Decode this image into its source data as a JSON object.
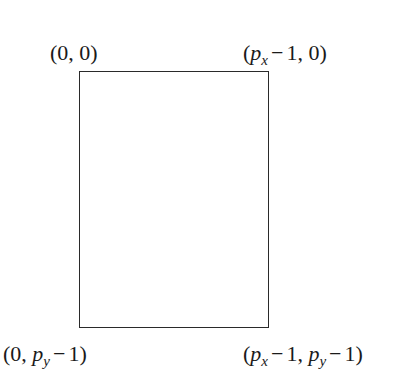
{
  "diagram": {
    "type": "pixel-coordinate-rectangle",
    "rectangle": {
      "stroke_color": "#2a2a2a",
      "fill": "none"
    },
    "corners": {
      "top_left": {
        "open": "(",
        "x": "0",
        "sep": ", ",
        "y": "0",
        "close": ")",
        "text": "(0,0)"
      },
      "top_right": {
        "open": "(",
        "x_var": "p",
        "x_sub": "x",
        "x_op": "−",
        "x_num": "1",
        "sep": ", ",
        "y": "0",
        "close": ")",
        "text": "(p_x − 1, 0)"
      },
      "bottom_left": {
        "open": "(",
        "x": "0",
        "sep": ", ",
        "y_var": "p",
        "y_sub": "y",
        "y_op": "−",
        "y_num": "1",
        "close": ")",
        "text": "(0, p_y − 1)"
      },
      "bottom_right": {
        "open": "(",
        "x_var": "p",
        "x_sub": "x",
        "x_op": "−",
        "x_num": "1",
        "sep": ", ",
        "y_var": "p",
        "y_sub": "y",
        "y_op": "−",
        "y_num": "1",
        "close": ")",
        "text": "(p_x − 1, p_y − 1)"
      }
    }
  }
}
